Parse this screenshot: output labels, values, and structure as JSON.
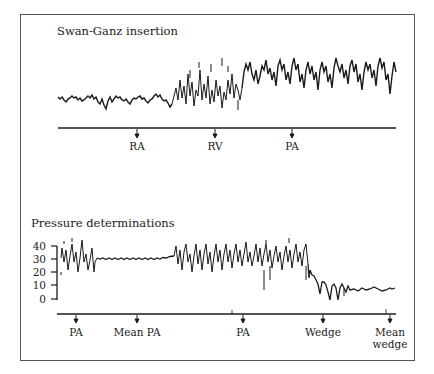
{
  "panels": {
    "insertion": {
      "title": "Swan-Ganz insertion",
      "markers": [
        {
          "label": "RA",
          "x": 137
        },
        {
          "label": "RV",
          "x": 215
        },
        {
          "label": "PA",
          "x": 292
        }
      ]
    },
    "pressure": {
      "title": "Pressure determinations",
      "y_ticks": [
        "40",
        "30",
        "20",
        "10",
        "0"
      ],
      "markers": [
        {
          "label": "PA",
          "x": 76
        },
        {
          "label": "Mean PA",
          "x": 137
        },
        {
          "label": "PA",
          "x": 243
        },
        {
          "label": "Wedge",
          "x": 323
        },
        {
          "label": "Mean",
          "label2": "wedge",
          "x": 390
        }
      ]
    }
  },
  "colors": {
    "trace": "#1a1a1a",
    "frame": "#555555",
    "background": "#ffffff"
  }
}
